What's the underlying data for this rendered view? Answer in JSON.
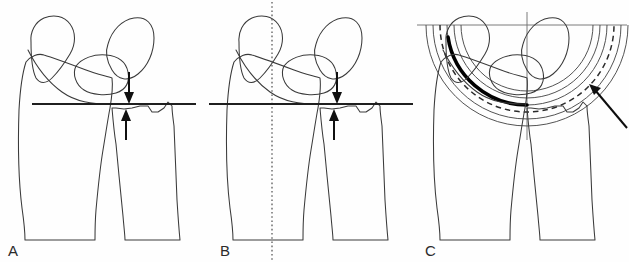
{
  "figure": {
    "background_color": "#fefefe",
    "ink_color": "#3a3a3a",
    "accent_color": "#000000",
    "width": 629,
    "height": 262
  },
  "panels": [
    {
      "id": "A",
      "label": "A",
      "caption": "Ulnar variance measured from a horizontal reference line drawn at the ulnar corner of the distal radius",
      "reference_line": {
        "name": "horizontal-reference-line",
        "orientation": "horizontal",
        "style": "solid",
        "y": 104,
        "x_start": 32,
        "x_end": 196
      },
      "arrows": [
        {
          "name": "variance-arrow-down",
          "direction": "down",
          "from_y": 72,
          "to_y": 102,
          "x": 129
        },
        {
          "name": "variance-arrow-up",
          "direction": "up",
          "from_y": 140,
          "to_y": 110,
          "x": 126
        }
      ],
      "bones": [
        "radius",
        "ulna",
        "scaphoid",
        "lunate",
        "triquetrum"
      ]
    },
    {
      "id": "B",
      "label": "B",
      "caption": "Same measurement referenced to the longitudinal axis of the radius shown as a vertical dotted line",
      "reference_line": {
        "name": "horizontal-reference-line",
        "orientation": "horizontal",
        "style": "solid",
        "y": 104,
        "x_start": 1,
        "x_end": 205
      },
      "axis_line": {
        "name": "vertical-axis-line",
        "orientation": "vertical",
        "style": "dotted",
        "x": 64,
        "y_start": 2,
        "y_end": 260
      },
      "arrows": [
        {
          "name": "variance-arrow-down",
          "direction": "down",
          "from_y": 72,
          "to_y": 102,
          "x": 129
        },
        {
          "name": "variance-arrow-up",
          "direction": "up",
          "from_y": 140,
          "to_y": 110,
          "x": 126
        }
      ],
      "bones": [
        "radius",
        "ulna",
        "scaphoid",
        "lunate",
        "triquetrum"
      ]
    },
    {
      "id": "C",
      "label": "C",
      "caption": "Concentric arc template centred on the crosshair; the dashed arc marks the best-fit circle and the bold arc the subchondral contour",
      "crosshair": {
        "name": "crosshair",
        "horizontal_y": 25,
        "vertical_x": 112,
        "style": "thin-solid"
      },
      "arcs": {
        "name": "concentric-arc-template",
        "center_x": 112,
        "center_y": 25,
        "radii": [
          66,
          73,
          80,
          87,
          94,
          101
        ],
        "dashed_radius": 87,
        "bold_radius": 80,
        "count": 6
      },
      "pointer": {
        "name": "annotation-arrow",
        "from_x": 212,
        "from_y": 128,
        "to_x": 174,
        "to_y": 84
      },
      "bones": [
        "radius",
        "ulna",
        "scaphoid",
        "lunate",
        "triquetrum"
      ]
    }
  ]
}
